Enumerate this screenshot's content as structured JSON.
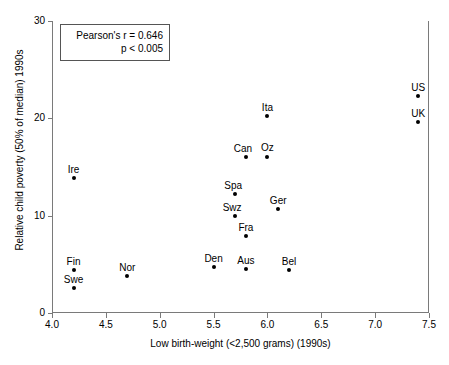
{
  "chart_data": {
    "type": "scatter",
    "title": "",
    "xlabel": "Low birth-weight (<2,500 grams) (1990s)",
    "ylabel": "Relative child poverty (50% of median) 1990s",
    "xlim": [
      4.0,
      7.5
    ],
    "ylim": [
      0,
      30
    ],
    "xticks": [
      "4.0",
      "4.5",
      "5.0",
      "5.5",
      "6.0",
      "6.5",
      "7.0",
      "7.5"
    ],
    "xtick_values": [
      4.0,
      4.5,
      5.0,
      5.5,
      6.0,
      6.5,
      7.0,
      7.5
    ],
    "yticks": [
      "0",
      "10",
      "20",
      "30"
    ],
    "ytick_values": [
      0,
      10,
      20,
      30
    ],
    "grid": false,
    "legend": "none",
    "annotations": [
      "Pearson's r = 0.646",
      "p < 0.005"
    ],
    "points": [
      {
        "label": "US",
        "x": 7.4,
        "y": 22.3,
        "label_dx": 0,
        "label_dy": -14
      },
      {
        "label": "UK",
        "x": 7.4,
        "y": 19.6,
        "label_dx": 0,
        "label_dy": -14
      },
      {
        "label": "Ita",
        "x": 6.0,
        "y": 20.2,
        "label_dx": 0,
        "label_dy": -14
      },
      {
        "label": "Can",
        "x": 5.8,
        "y": 16.0,
        "label_dx": -3,
        "label_dy": -14
      },
      {
        "label": "Oz",
        "x": 6.0,
        "y": 16.0,
        "label_dx": 0,
        "label_dy": -15
      },
      {
        "label": "Ire",
        "x": 4.2,
        "y": 13.9,
        "label_dx": 0,
        "label_dy": -14
      },
      {
        "label": "Spa",
        "x": 5.7,
        "y": 12.2,
        "label_dx": -2,
        "label_dy": -14
      },
      {
        "label": "Ger",
        "x": 6.1,
        "y": 10.7,
        "label_dx": 0,
        "label_dy": -14
      },
      {
        "label": "Swz",
        "x": 5.7,
        "y": 10.0,
        "label_dx": -3,
        "label_dy": -14
      },
      {
        "label": "Fra",
        "x": 5.8,
        "y": 7.9,
        "label_dx": 0,
        "label_dy": -14
      },
      {
        "label": "Den",
        "x": 5.5,
        "y": 4.7,
        "label_dx": 0,
        "label_dy": -14
      },
      {
        "label": "Aus",
        "x": 5.8,
        "y": 4.5,
        "label_dx": 0,
        "label_dy": -14
      },
      {
        "label": "Bel",
        "x": 6.2,
        "y": 4.4,
        "label_dx": 0,
        "label_dy": -14
      },
      {
        "label": "Fin",
        "x": 4.2,
        "y": 4.4,
        "label_dx": 0,
        "label_dy": -14
      },
      {
        "label": "Nor",
        "x": 4.7,
        "y": 3.8,
        "label_dx": 0,
        "label_dy": -14
      },
      {
        "label": "Swe",
        "x": 4.2,
        "y": 2.6,
        "label_dx": 0,
        "label_dy": -14
      }
    ]
  },
  "colors": {
    "marker": "#000000",
    "axis": "#7a7a7a",
    "box_border": "#555555",
    "background": "#ffffff"
  }
}
